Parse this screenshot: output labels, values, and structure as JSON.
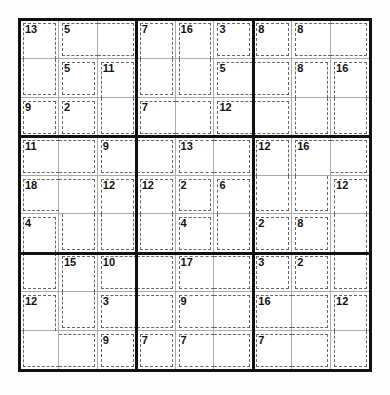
{
  "puzzle": {
    "type": "Killer Sudoku",
    "size": 9,
    "cages": [
      {
        "sum": 13,
        "cells": [
          [
            0,
            0
          ],
          [
            1,
            0
          ]
        ]
      },
      {
        "sum": 5,
        "cells": [
          [
            0,
            1
          ],
          [
            0,
            2
          ]
        ]
      },
      {
        "sum": 7,
        "cells": [
          [
            0,
            3
          ],
          [
            1,
            3
          ]
        ]
      },
      {
        "sum": 16,
        "cells": [
          [
            0,
            4
          ],
          [
            1,
            4
          ]
        ]
      },
      {
        "sum": 3,
        "cells": [
          [
            0,
            5
          ]
        ]
      },
      {
        "sum": 8,
        "cells": [
          [
            0,
            6
          ]
        ]
      },
      {
        "sum": 8,
        "cells": [
          [
            0,
            7
          ],
          [
            0,
            8
          ]
        ]
      },
      {
        "sum": 5,
        "cells": [
          [
            1,
            1
          ]
        ]
      },
      {
        "sum": 11,
        "cells": [
          [
            1,
            2
          ],
          [
            2,
            2
          ]
        ]
      },
      {
        "sum": 5,
        "cells": [
          [
            1,
            5
          ],
          [
            1,
            6
          ]
        ]
      },
      {
        "sum": 8,
        "cells": [
          [
            1,
            7
          ],
          [
            2,
            7
          ]
        ]
      },
      {
        "sum": 16,
        "cells": [
          [
            1,
            8
          ],
          [
            2,
            8
          ]
        ]
      },
      {
        "sum": 9,
        "cells": [
          [
            2,
            0
          ]
        ]
      },
      {
        "sum": 2,
        "cells": [
          [
            2,
            1
          ]
        ]
      },
      {
        "sum": 7,
        "cells": [
          [
            2,
            3
          ],
          [
            2,
            4
          ]
        ]
      },
      {
        "sum": 12,
        "cells": [
          [
            2,
            5
          ],
          [
            2,
            6
          ]
        ]
      },
      {
        "sum": 11,
        "cells": [
          [
            3,
            0
          ],
          [
            3,
            1
          ]
        ]
      },
      {
        "sum": 9,
        "cells": [
          [
            3,
            2
          ],
          [
            3,
            3
          ]
        ]
      },
      {
        "sum": 13,
        "cells": [
          [
            3,
            4
          ],
          [
            3,
            5
          ]
        ]
      },
      {
        "sum": 12,
        "cells": [
          [
            3,
            6
          ],
          [
            4,
            6
          ]
        ]
      },
      {
        "sum": 16,
        "cells": [
          [
            3,
            7
          ],
          [
            3,
            8
          ],
          [
            4,
            7
          ]
        ]
      },
      {
        "sum": 18,
        "cells": [
          [
            4,
            0
          ],
          [
            4,
            1
          ],
          [
            5,
            1
          ]
        ]
      },
      {
        "sum": 12,
        "cells": [
          [
            4,
            2
          ],
          [
            5,
            2
          ]
        ]
      },
      {
        "sum": 12,
        "cells": [
          [
            4,
            3
          ],
          [
            5,
            3
          ]
        ]
      },
      {
        "sum": 2,
        "cells": [
          [
            4,
            4
          ]
        ]
      },
      {
        "sum": 6,
        "cells": [
          [
            4,
            5
          ],
          [
            5,
            5
          ]
        ]
      },
      {
        "sum": 12,
        "cells": [
          [
            4,
            8
          ],
          [
            5,
            8
          ],
          [
            6,
            8
          ]
        ]
      },
      {
        "sum": 4,
        "cells": [
          [
            5,
            0
          ],
          [
            6,
            0
          ]
        ]
      },
      {
        "sum": 4,
        "cells": [
          [
            5,
            4
          ]
        ]
      },
      {
        "sum": 2,
        "cells": [
          [
            5,
            6
          ]
        ]
      },
      {
        "sum": 8,
        "cells": [
          [
            5,
            7
          ]
        ]
      },
      {
        "sum": 15,
        "cells": [
          [
            6,
            1
          ],
          [
            7,
            1
          ]
        ]
      },
      {
        "sum": 10,
        "cells": [
          [
            6,
            2
          ],
          [
            6,
            3
          ]
        ]
      },
      {
        "sum": 17,
        "cells": [
          [
            6,
            4
          ],
          [
            6,
            5
          ]
        ]
      },
      {
        "sum": 3,
        "cells": [
          [
            6,
            6
          ]
        ]
      },
      {
        "sum": 2,
        "cells": [
          [
            6,
            7
          ]
        ]
      },
      {
        "sum": 12,
        "cells": [
          [
            7,
            0
          ],
          [
            8,
            0
          ],
          [
            8,
            1
          ]
        ]
      },
      {
        "sum": 3,
        "cells": [
          [
            7,
            2
          ],
          [
            7,
            3
          ]
        ]
      },
      {
        "sum": 9,
        "cells": [
          [
            7,
            4
          ],
          [
            7,
            5
          ]
        ]
      },
      {
        "sum": 16,
        "cells": [
          [
            7,
            6
          ],
          [
            7,
            7
          ]
        ]
      },
      {
        "sum": 12,
        "cells": [
          [
            7,
            8
          ],
          [
            8,
            8
          ]
        ]
      },
      {
        "sum": 9,
        "cells": [
          [
            8,
            2
          ]
        ]
      },
      {
        "sum": 7,
        "cells": [
          [
            8,
            3
          ]
        ]
      },
      {
        "sum": 7,
        "cells": [
          [
            8,
            4
          ],
          [
            8,
            5
          ]
        ]
      },
      {
        "sum": 7,
        "cells": [
          [
            8,
            6
          ],
          [
            8,
            7
          ]
        ]
      }
    ],
    "colors": {
      "grid": "#111111",
      "thin": "#aaaaaa",
      "cage": "#666666"
    }
  }
}
